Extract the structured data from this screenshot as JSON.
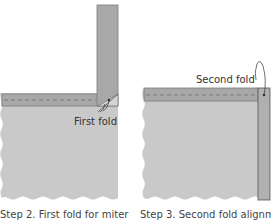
{
  "colors": {
    "fabric": "#c9c9c9",
    "strip": "#a8a8a8",
    "strip_edge": "#7a7a7a",
    "dash": "#6e6e6e",
    "text": "#333333"
  },
  "panels": [
    {
      "id": "step2",
      "label": "First fold",
      "caption": "Step 2. First fold for miter"
    },
    {
      "id": "step3",
      "label": "Second fold",
      "caption": "Step 3. Second fold alignment"
    }
  ]
}
